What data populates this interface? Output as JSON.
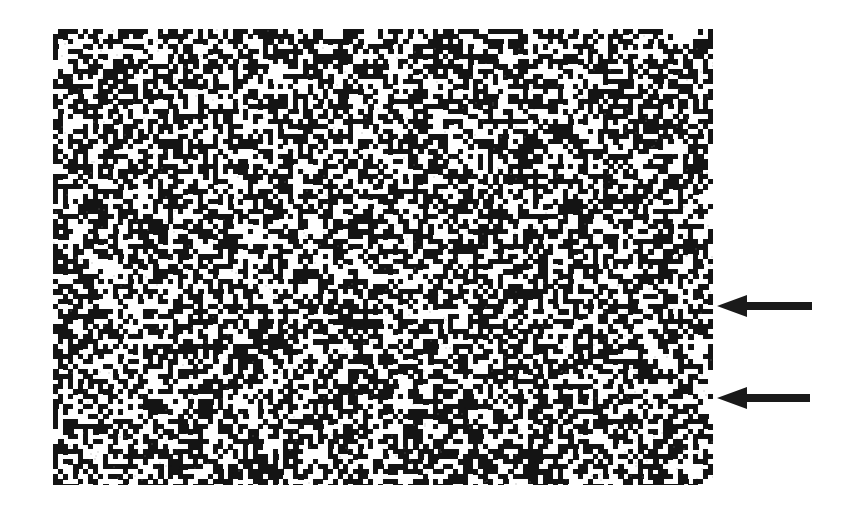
{
  "figure": {
    "kind": "scanned-autoradiograph-noise-panel",
    "background_color": "#ffffff",
    "ink_color": "#1a1a1a",
    "canvas": {
      "width": 862,
      "height": 517
    }
  },
  "noise_panel": {
    "name": "random-block-pattern",
    "x": 53,
    "y": 29,
    "width": 660,
    "height": 456,
    "block_size": 5,
    "black_fraction": 0.52,
    "foreground_color": "#141414",
    "background_color": "#ffffff",
    "seed": 20240517
  },
  "annotations": {
    "count": 2,
    "direction": "left",
    "color": "#1a1a1a",
    "arrows": [
      {
        "label": "upper-arrow",
        "tip_x": 717,
        "tip_y": 306,
        "tail_x": 812,
        "length": 95,
        "head_length": 30,
        "head_half_height": 11,
        "shaft_half_height": 4
      },
      {
        "label": "lower-arrow",
        "tip_x": 717,
        "tip_y": 398,
        "tail_x": 810,
        "length": 93,
        "head_length": 30,
        "head_half_height": 11,
        "shaft_half_height": 4
      }
    ]
  },
  "chart_data": {
    "type": "heatmap",
    "title": "",
    "xlabel": "",
    "ylabel": "",
    "grid": false,
    "legend": "none",
    "cols": 132,
    "rows": 92,
    "cell_size_px": 5,
    "value_levels": [
      0,
      1
    ],
    "value_colors": [
      "#ffffff",
      "#141414"
    ],
    "fill_ratio": 0.52,
    "annotations": [
      {
        "text": "",
        "marker": "arrow-left",
        "x": 717,
        "y": 306
      },
      {
        "text": "",
        "marker": "arrow-left",
        "x": 717,
        "y": 398
      }
    ]
  }
}
